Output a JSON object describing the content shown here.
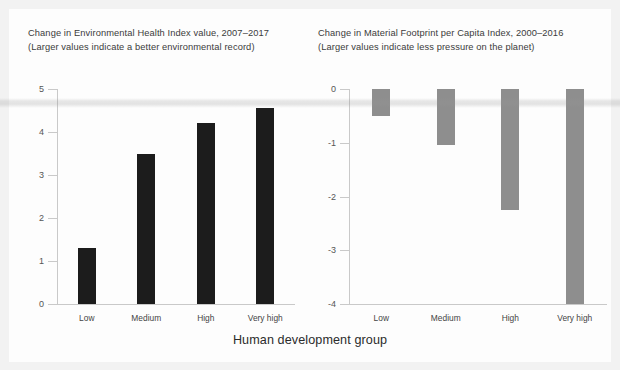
{
  "figure": {
    "axis_title": "Human development group",
    "colors": {
      "bar_dark": "#1c1c1c",
      "bar_gray": "#8e8e8e",
      "axis": "#c9c9c9",
      "title_text": "#3b3b3b",
      "background": "#fdfdfd"
    }
  },
  "chart_data": [
    {
      "type": "bar",
      "panel": "left",
      "title": "Change in Environmental Health Index value, 2007–2017",
      "subtitle": "(Larger values indicate a better environmental record)",
      "categories": [
        "Low",
        "Medium",
        "High",
        "Very high"
      ],
      "values": [
        1.3,
        3.5,
        4.2,
        4.55
      ],
      "xlabel": "Human development group",
      "ylabel": "",
      "ylim": [
        0,
        5
      ],
      "yticks": [
        0,
        1,
        2,
        3,
        4,
        5
      ],
      "ytick_labels": [
        "0",
        "1",
        "2",
        "3",
        "4",
        "5"
      ],
      "grid": false,
      "legend": "none",
      "bar_color": "#1c1c1c"
    },
    {
      "type": "bar",
      "panel": "right",
      "title": "Change in Material Footprint per Capita Index, 2000–2016",
      "subtitle": "(Larger values indicate less pressure on the planet)",
      "categories": [
        "Low",
        "Medium",
        "High",
        "Very high"
      ],
      "values": [
        -0.5,
        -1.05,
        -2.25,
        -4.0
      ],
      "xlabel": "Human development group",
      "ylabel": "",
      "ylim": [
        -4,
        0
      ],
      "yticks": [
        0,
        -1,
        -2,
        -3,
        -4
      ],
      "ytick_labels": [
        "0",
        "-1",
        "-2",
        "-3",
        "-4"
      ],
      "grid": false,
      "legend": "none",
      "bar_color": "#8e8e8e"
    }
  ]
}
